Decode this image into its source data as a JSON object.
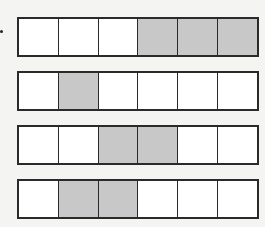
{
  "diagram": {
    "type": "fraction-bars",
    "cells_per_bar": 6,
    "shade_color": "#c8c8c8",
    "empty_color": "#ffffff",
    "border_color": "#2a2a2a",
    "bars": [
      {
        "shaded": [
          false,
          false,
          false,
          true,
          true,
          true
        ],
        "shaded_count": 3
      },
      {
        "shaded": [
          false,
          true,
          false,
          false,
          false,
          false
        ],
        "shaded_count": 1
      },
      {
        "shaded": [
          false,
          false,
          true,
          true,
          false,
          false
        ],
        "shaded_count": 2
      },
      {
        "shaded": [
          false,
          true,
          true,
          false,
          false,
          false
        ],
        "shaded_count": 2
      }
    ]
  }
}
